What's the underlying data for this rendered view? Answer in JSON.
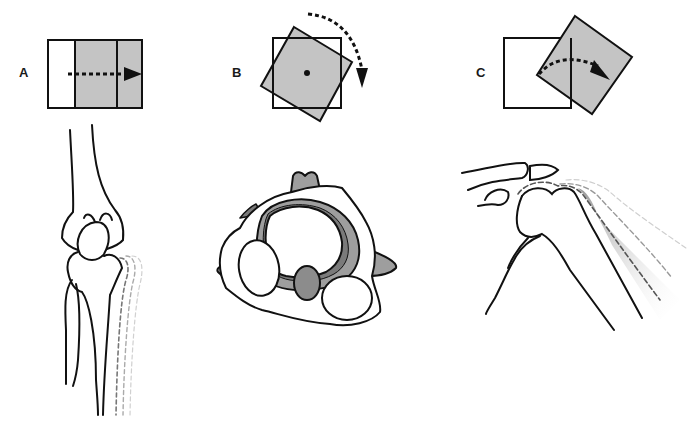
{
  "figure": {
    "colors": {
      "outline": "#111111",
      "fill_gray": "#c4c4c4",
      "dark_gray": "#7a7a7a",
      "mid_gray": "#9e9e9e",
      "background": "#ffffff"
    },
    "panels": [
      {
        "id": "A",
        "label": "A",
        "schematic": "square divided into three vertical sections, gray region with dashed arrow pointing right (translation)",
        "anatomy": "knee joint — femur over tibia and fibula with dashed ghost outlines showing lateral translation"
      },
      {
        "id": "B",
        "label": "B",
        "schematic": "square with overlaid gray rotated square around center dot, dashed curved arrow clockwise (rotation)",
        "anatomy": "axial view of vertebra showing rotation"
      },
      {
        "id": "C",
        "label": "C",
        "schematic": "square with gray square rotated about a corner, dashed curved arrow (angular rotation / abduction)",
        "anatomy": "shoulder joint — humeral head with dashed ghost outlines showing abduction"
      }
    ]
  }
}
